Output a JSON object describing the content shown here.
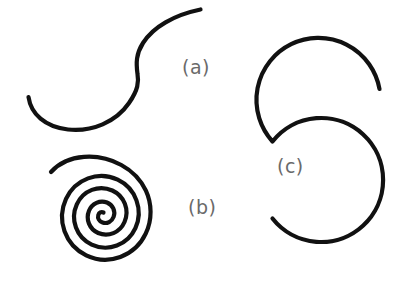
{
  "figure": {
    "background_color": "#ffffff",
    "stroke_color": "#111111",
    "label_color": "#6a6a6a",
    "stroke_width": 4.2,
    "width": 419,
    "height": 284
  },
  "panels": [
    {
      "id": "a",
      "label": "(a)",
      "label_x": 182,
      "label_y": 68,
      "shape_name": "s-shaped-open-curve",
      "description": "Open S-shaped curve; lower hook opens left, upper tail rises to the right"
    },
    {
      "id": "b",
      "label": "(b)",
      "label_x": 188,
      "label_y": 208,
      "shape_name": "archimedean-spiral",
      "description": "Archimedean spiral of about 2.5 counterclockwise turns unwinding from center to upper right",
      "center_x": 103,
      "center_y": 212,
      "turns": 2.6,
      "max_radius": 58
    },
    {
      "id": "c",
      "label": "(c)",
      "label_x": 277,
      "label_y": 167,
      "shape_name": "double-arc-s-shape",
      "description": "Large S formed by two nearly complete circular arcs joined at the middle",
      "upper_circle": {
        "cx": 318,
        "cy": 79,
        "r": 62
      },
      "lower_circle": {
        "cx": 332,
        "cy": 205,
        "r": 62
      }
    }
  ]
}
